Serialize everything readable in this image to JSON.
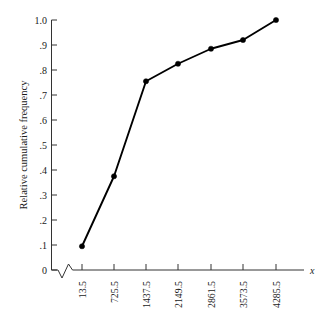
{
  "chart_data": {
    "type": "line",
    "title": "",
    "xlabel": "x",
    "ylabel": "Relative cumulative frequency",
    "categories": [
      "13.5",
      "725.5",
      "1437.5",
      "2149.5",
      "2861.5",
      "3573.5",
      "4285.5"
    ],
    "x": [
      13.5,
      725.5,
      1437.5,
      2149.5,
      2861.5,
      3573.5,
      4285.5
    ],
    "values": [
      0.095,
      0.375,
      0.755,
      0.825,
      0.885,
      0.92,
      1.0
    ],
    "series": [
      {
        "name": "Relative cumulative frequency",
        "values": [
          0.095,
          0.375,
          0.755,
          0.825,
          0.885,
          0.92,
          1.0
        ]
      }
    ],
    "ylim": [
      0,
      1.0
    ],
    "ytick_labels": [
      "1.0",
      ".9",
      ".8",
      ".7",
      ".6",
      ".5",
      ".4",
      ".3",
      ".2",
      ".1",
      "0"
    ],
    "ytick_values": [
      1.0,
      0.9,
      0.8,
      0.7,
      0.6,
      0.5,
      0.4,
      0.3,
      0.2,
      0.1,
      0.0
    ],
    "grid": false,
    "legend": "none",
    "axis_break": true,
    "marker": "filled-circle",
    "line_color": "#000000",
    "axis_color": "#333333",
    "background_color": "#ffffff"
  },
  "axes": {
    "y_title": "Relative cumulative frequency",
    "x_axis_name": "x",
    "y_ticks": [
      {
        "label": "1.0",
        "value": 1.0
      },
      {
        "label": ".9",
        "value": 0.9
      },
      {
        "label": ".8",
        "value": 0.8
      },
      {
        "label": ".7",
        "value": 0.7
      },
      {
        "label": ".6",
        "value": 0.6
      },
      {
        "label": ".5",
        "value": 0.5
      },
      {
        "label": ".4",
        "value": 0.4
      },
      {
        "label": ".3",
        "value": 0.3
      },
      {
        "label": ".2",
        "value": 0.2
      },
      {
        "label": ".1",
        "value": 0.1
      },
      {
        "label": "0",
        "value": 0.0
      }
    ],
    "x_ticks": [
      {
        "label": "13.5",
        "value": 13.5
      },
      {
        "label": "725.5",
        "value": 725.5
      },
      {
        "label": "1437.5",
        "value": 1437.5
      },
      {
        "label": "2149.5",
        "value": 2149.5
      },
      {
        "label": "2861.5",
        "value": 2861.5
      },
      {
        "label": "3573.5",
        "value": 3573.5
      },
      {
        "label": "4285.5",
        "value": 4285.5
      }
    ]
  }
}
